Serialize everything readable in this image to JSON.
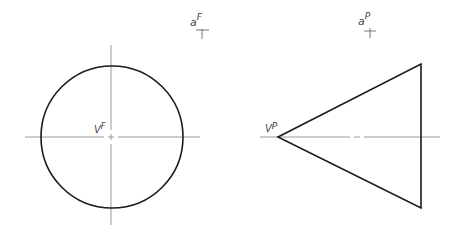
{
  "figure": {
    "front_view": {
      "label_vanishing": "V",
      "label_vanishing_sup": "F",
      "label_point": "a",
      "label_point_sup": "F",
      "shape": "circle"
    },
    "profile_view": {
      "label_vanishing": "V",
      "label_vanishing_sup": "P",
      "label_point": "a",
      "label_point_sup": "P",
      "shape": "triangle"
    }
  },
  "colors": {
    "outline": "#1a1a1a",
    "centerline": "#9a9a9a",
    "label": "#444444"
  }
}
